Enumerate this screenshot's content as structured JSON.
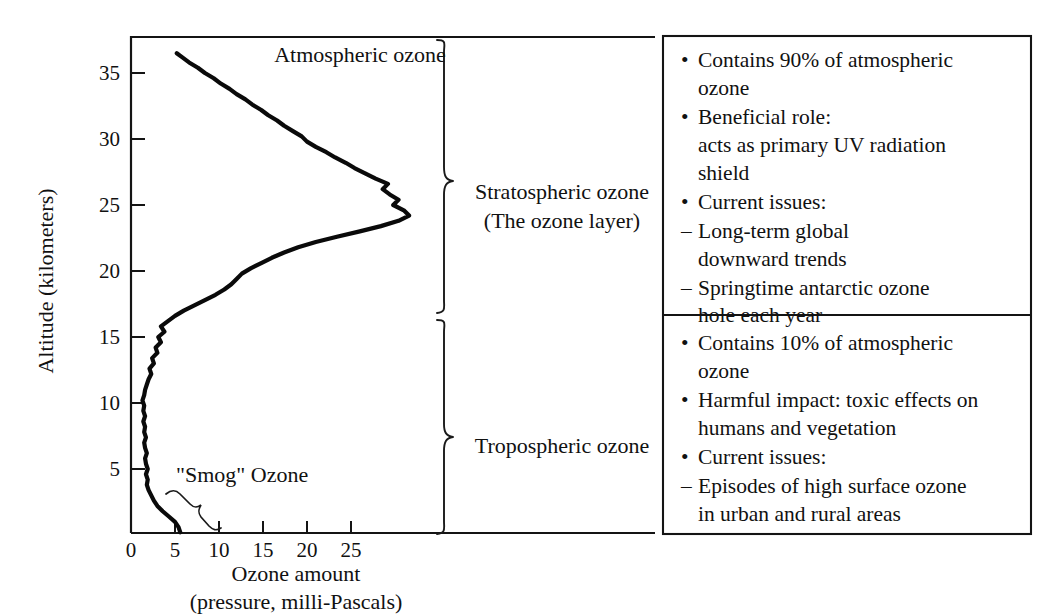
{
  "figure": {
    "title": "Atmospheric ozone",
    "smog_label": "\"Smog\" Ozone"
  },
  "axes": {
    "y_title": "Altitude (kilometers)",
    "x_title_line1": "Ozone amount",
    "x_title_line2": "(pressure, milli-Pascals)",
    "y_ticks": [
      "35",
      "30",
      "25",
      "20",
      "15",
      "10",
      "5"
    ],
    "x_ticks": [
      "0",
      "5",
      "10",
      "15",
      "20",
      "25"
    ]
  },
  "regions": {
    "stratosphere_line1": "Stratospheric ozone",
    "stratosphere_line2": "(The ozone layer)",
    "troposphere": "Tropospheric ozone"
  },
  "panels": [
    {
      "id": "stratospheric-panel",
      "items": [
        {
          "mark": "•",
          "text": "Contains 90% of atmospheric",
          "cont": [
            "ozone"
          ]
        },
        {
          "mark": "•",
          "text": "Beneficial role:",
          "cont": [
            "acts as primary UV radiation",
            "shield"
          ]
        },
        {
          "mark": "•",
          "text": "Current issues:",
          "cont": []
        },
        {
          "mark": "–",
          "text": "Long-term global",
          "cont": [
            "downward trends"
          ]
        },
        {
          "mark": "–",
          "text": "Springtime antarctic ozone",
          "cont": [
            "hole each year"
          ]
        }
      ]
    },
    {
      "id": "tropospheric-panel",
      "items": [
        {
          "mark": "•",
          "text": "Contains 10% of atmospheric",
          "cont": [
            "ozone"
          ]
        },
        {
          "mark": "•",
          "text": "Harmful impact: toxic effects on",
          "cont": [
            "humans and vegetation"
          ]
        },
        {
          "mark": "•",
          "text": "Current issues:",
          "cont": []
        },
        {
          "mark": "–",
          "text": "Episodes of high surface ozone",
          "cont": [
            "in urban and rural areas"
          ]
        }
      ]
    }
  ],
  "colors": {
    "ink": "#111111",
    "curve": "#0a0a0a",
    "background": "#ffffff"
  },
  "chart_data": {
    "type": "line",
    "title": "Atmospheric ozone",
    "xlabel": "Ozone amount (pressure, milli-Pascals)",
    "ylabel": "Altitude (kilometers)",
    "xlim": [
      0,
      30.5
    ],
    "ylim": [
      0,
      36.8
    ],
    "xticks": [
      0,
      5,
      10,
      15,
      20,
      25
    ],
    "yticks": [
      5,
      10,
      15,
      20,
      25,
      30,
      35
    ],
    "grid": false,
    "legend": null,
    "orientation": "vertical-profile",
    "series": [
      {
        "name": "Ozone partial pressure profile",
        "x_unit": "milli-Pascals",
        "y_unit": "kilometers",
        "points": [
          [
            5.6,
            0.2
          ],
          [
            5.4,
            0.6
          ],
          [
            5.0,
            1.0
          ],
          [
            4.3,
            1.4
          ],
          [
            3.6,
            1.8
          ],
          [
            3.0,
            2.2
          ],
          [
            2.6,
            2.6
          ],
          [
            2.3,
            3.0
          ],
          [
            2.0,
            3.4
          ],
          [
            1.8,
            3.8
          ],
          [
            1.9,
            4.2
          ],
          [
            1.7,
            4.6
          ],
          [
            1.9,
            5.0
          ],
          [
            1.7,
            5.4
          ],
          [
            1.6,
            5.8
          ],
          [
            1.8,
            6.2
          ],
          [
            1.6,
            6.6
          ],
          [
            1.5,
            7.0
          ],
          [
            1.7,
            7.4
          ],
          [
            1.5,
            7.8
          ],
          [
            1.6,
            8.2
          ],
          [
            1.4,
            8.6
          ],
          [
            1.6,
            9.0
          ],
          [
            1.4,
            9.4
          ],
          [
            1.5,
            9.8
          ],
          [
            1.3,
            10.2
          ],
          [
            1.5,
            10.6
          ],
          [
            1.6,
            11.0
          ],
          [
            1.8,
            11.4
          ],
          [
            2.0,
            11.8
          ],
          [
            2.3,
            12.2
          ],
          [
            2.1,
            12.6
          ],
          [
            2.6,
            13.0
          ],
          [
            2.4,
            13.4
          ],
          [
            3.0,
            13.8
          ],
          [
            2.8,
            14.2
          ],
          [
            3.4,
            14.6
          ],
          [
            3.1,
            15.0
          ],
          [
            3.8,
            15.4
          ],
          [
            3.4,
            15.8
          ],
          [
            4.2,
            16.2
          ],
          [
            5.0,
            16.6
          ],
          [
            6.0,
            17.0
          ],
          [
            7.2,
            17.4
          ],
          [
            8.4,
            17.8
          ],
          [
            9.6,
            18.2
          ],
          [
            10.6,
            18.6
          ],
          [
            11.4,
            19.0
          ],
          [
            12.0,
            19.4
          ],
          [
            12.6,
            19.8
          ],
          [
            13.6,
            20.2
          ],
          [
            14.8,
            20.6
          ],
          [
            16.0,
            21.0
          ],
          [
            17.4,
            21.4
          ],
          [
            19.0,
            21.8
          ],
          [
            21.0,
            22.2
          ],
          [
            23.4,
            22.6
          ],
          [
            26.0,
            23.0
          ],
          [
            28.4,
            23.4
          ],
          [
            30.4,
            23.8
          ],
          [
            31.6,
            24.2
          ],
          [
            31.0,
            24.6
          ],
          [
            29.8,
            25.0
          ],
          [
            30.4,
            25.4
          ],
          [
            29.4,
            25.8
          ],
          [
            28.6,
            26.2
          ],
          [
            29.2,
            26.6
          ],
          [
            27.8,
            27.0
          ],
          [
            26.6,
            27.4
          ],
          [
            25.4,
            27.8
          ],
          [
            24.4,
            28.2
          ],
          [
            23.2,
            28.6
          ],
          [
            22.2,
            29.0
          ],
          [
            21.0,
            29.4
          ],
          [
            20.0,
            29.8
          ],
          [
            19.4,
            30.2
          ],
          [
            18.4,
            30.6
          ],
          [
            17.4,
            31.0
          ],
          [
            16.6,
            31.4
          ],
          [
            15.6,
            31.8
          ],
          [
            14.8,
            32.2
          ],
          [
            13.8,
            32.6
          ],
          [
            13.0,
            33.0
          ],
          [
            12.0,
            33.4
          ],
          [
            11.2,
            33.8
          ],
          [
            10.2,
            34.2
          ],
          [
            9.4,
            34.6
          ],
          [
            8.4,
            35.0
          ],
          [
            7.6,
            35.4
          ],
          [
            6.6,
            35.8
          ],
          [
            5.8,
            36.2
          ],
          [
            5.2,
            36.5
          ]
        ]
      }
    ],
    "annotations": [
      {
        "text": "Atmospheric ozone",
        "x": 13.5,
        "y": 36.0
      },
      {
        "text": "\"Smog\" Ozone",
        "x": 8.0,
        "y": 4.2
      },
      {
        "text": "Stratospheric ozone (The ozone layer)",
        "y_range": [
          16.0,
          36.8
        ]
      },
      {
        "text": "Tropospheric ozone",
        "y_range": [
          0.0,
          16.0
        ]
      }
    ]
  }
}
